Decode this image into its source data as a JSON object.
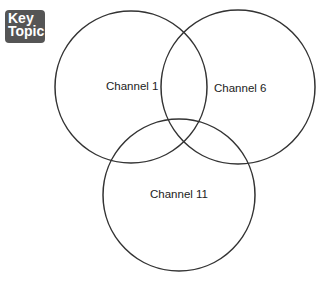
{
  "badge": {
    "line1": "Key",
    "line2": "Topic",
    "color": "#555555"
  },
  "diagram": {
    "type": "venn",
    "circles": [
      {
        "label": "Channel 1",
        "cx": 131,
        "cy": 87,
        "r": 76
      },
      {
        "label": "Channel 6",
        "cx": 238,
        "cy": 87,
        "r": 77
      },
      {
        "label": "Channel 11",
        "cx": 179,
        "cy": 195,
        "r": 76
      }
    ],
    "stroke": "#333333"
  }
}
